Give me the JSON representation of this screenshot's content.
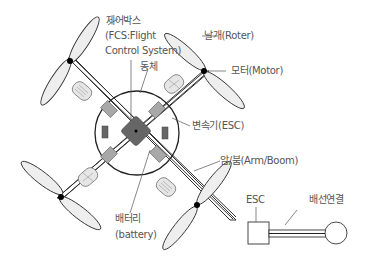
{
  "diagram": {
    "type": "quadcopter-components",
    "colors": {
      "line": "#333333",
      "propeller_fill": "#eeeeee",
      "esc_fill": "#a8a8a8",
      "controller_fill": "#666666",
      "battery_fill": "#e4e4e4",
      "motor": "#000000",
      "label": "#555555"
    }
  },
  "labels": {
    "control_box_line1": "제어박스",
    "control_box_line2": "(FCS:Flight",
    "control_box_line3": "Control System)",
    "body": "동체",
    "rotor": "날개(Roter)",
    "motor": "모터(Motor)",
    "esc": "변속기(ESC)",
    "arm": "암/붐(Arm/Boom)",
    "battery_line1": "배터리",
    "battery_line2": "(battery)",
    "inset_esc": "ESC",
    "inset_wiring": "배선연결"
  }
}
